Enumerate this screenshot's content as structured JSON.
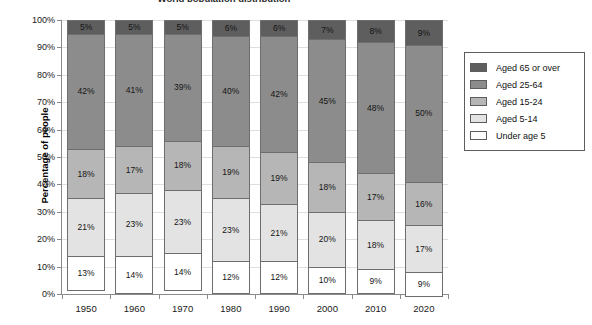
{
  "chart_data": {
    "type": "bar",
    "subtype": "stacked-percentage-column",
    "title": "World population distribution",
    "xlabel": "",
    "ylabel": "Percentage of people",
    "ylim": [
      0,
      100
    ],
    "ytick_labels": [
      "0%",
      "10%",
      "20%",
      "30%",
      "40%",
      "50%",
      "60%",
      "70%",
      "80%",
      "90%",
      "100%"
    ],
    "ytick_values": [
      0,
      10,
      20,
      30,
      40,
      50,
      60,
      70,
      80,
      90,
      100
    ],
    "grid": true,
    "legend_position": "right",
    "categories": [
      "1950",
      "1960",
      "1970",
      "1980",
      "1990",
      "2000",
      "2010",
      "2020"
    ],
    "series": [
      {
        "name": "Under age 5",
        "color": "#ffffff",
        "values": [
          13,
          14,
          14,
          12,
          12,
          10,
          9,
          9
        ],
        "labels": [
          "13%",
          "14%",
          "14%",
          "12%",
          "12%",
          "10%",
          "9%",
          "9%"
        ]
      },
      {
        "name": "Aged 5-14",
        "color": "#e3e3e3",
        "values": [
          21,
          23,
          23,
          23,
          21,
          20,
          18,
          17
        ],
        "labels": [
          "21%",
          "23%",
          "23%",
          "23%",
          "21%",
          "20%",
          "18%",
          "17%"
        ]
      },
      {
        "name": "Aged 15-24",
        "color": "#b6b6b6",
        "values": [
          18,
          17,
          18,
          19,
          19,
          18,
          17,
          16
        ],
        "labels": [
          "18%",
          "17%",
          "18%",
          "19%",
          "19%",
          "18%",
          "17%",
          "16%"
        ]
      },
      {
        "name": "Aged 25-64",
        "color": "#8c8c8c",
        "values": [
          42,
          41,
          39,
          40,
          42,
          45,
          48,
          50
        ],
        "labels": [
          "42%",
          "41%",
          "39%",
          "40%",
          "42%",
          "45%",
          "48%",
          "50%"
        ]
      },
      {
        "name": "Aged 65 or over",
        "color": "#5e5e5e",
        "values": [
          5,
          5,
          5,
          6,
          6,
          7,
          8,
          9
        ],
        "labels": [
          "5%",
          "5%",
          "5%",
          "6%",
          "6%",
          "7%",
          "8%",
          "9%"
        ]
      }
    ]
  },
  "legend": {
    "items": [
      {
        "label": "Aged 65 or over",
        "color": "#5e5e5e"
      },
      {
        "label": "Aged 25-64",
        "color": "#8c8c8c"
      },
      {
        "label": "Aged 15-24",
        "color": "#b6b6b6"
      },
      {
        "label": "Aged 5-14",
        "color": "#e3e3e3"
      },
      {
        "label": "Under age 5",
        "color": "#ffffff"
      }
    ]
  },
  "style": {
    "axis_color": "#8a8a8a",
    "grid_color": "#dedede",
    "segment_border": "#6e6e6e",
    "text_color": "#1a1a1a",
    "background": "#ffffff"
  }
}
